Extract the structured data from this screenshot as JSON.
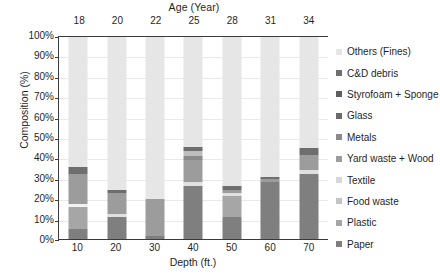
{
  "chart_data": {
    "type": "bar",
    "subtype": "stacked-100-percent",
    "title": "Age (Year)",
    "xlabel": "Depth (ft.)",
    "ylabel": "Composition (%)",
    "ylim": [
      0,
      100
    ],
    "ytick_labels": [
      "0%",
      "10%",
      "20%",
      "30%",
      "40%",
      "50%",
      "60%",
      "70%",
      "80%",
      "90%",
      "100%"
    ],
    "ytick_values": [
      0,
      10,
      20,
      30,
      40,
      50,
      60,
      70,
      80,
      90,
      100
    ],
    "grid": true,
    "legend_position": "right",
    "categories": [
      "10",
      "20",
      "30",
      "40",
      "50",
      "60",
      "70"
    ],
    "top_axis_label": "Age (Year)",
    "top_categories": [
      "18",
      "20",
      "22",
      "25",
      "28",
      "31",
      "34"
    ],
    "series": [
      {
        "name": "Paper",
        "color": "#7f7f7f",
        "values": [
          5.0,
          11.0,
          1.5,
          26.0,
          11.0,
          28.0,
          32.0
        ]
      },
      {
        "name": "Plastic",
        "color": "#a6a6a6",
        "values": [
          11.0,
          0.0,
          0.0,
          0.0,
          10.5,
          0.0,
          0.0
        ]
      },
      {
        "name": "Food waste",
        "color": "#f2f2f2",
        "values": [
          1.5,
          0.0,
          0.0,
          0.0,
          0.0,
          0.0,
          0.0
        ]
      },
      {
        "name": "Textile",
        "color": "#e0e0e0",
        "values": [
          0.0,
          1.2,
          0.0,
          2.0,
          1.5,
          0.0,
          2.0
        ]
      },
      {
        "name": "Yard waste + Wood",
        "color": "#9c9c9c",
        "values": [
          14.5,
          10.5,
          18.5,
          11.0,
          1.5,
          1.8,
          7.5
        ]
      },
      {
        "name": "Metals",
        "color": "#8a8a8a",
        "values": [
          0.0,
          0.0,
          0.0,
          2.0,
          0.0,
          0.0,
          0.0
        ]
      },
      {
        "name": "Glass",
        "color": "#bdbdbd",
        "values": [
          0.0,
          0.0,
          0.0,
          2.5,
          0.0,
          0.0,
          0.0
        ]
      },
      {
        "name": "Styrofoam + Sponge",
        "color": "#d2d2d2",
        "values": [
          0.0,
          0.0,
          0.0,
          0.0,
          0.0,
          0.0,
          0.0
        ]
      },
      {
        "name": "C&D debris",
        "color": "#6e6e6e",
        "values": [
          3.5,
          1.8,
          0.0,
          2.0,
          1.8,
          0.8,
          3.5
        ]
      },
      {
        "name": "Others (Fines)",
        "color": "#e6e6e6",
        "values": [
          64.5,
          75.5,
          80.0,
          54.5,
          73.7,
          69.4,
          55.0
        ]
      }
    ],
    "legend_entries": [
      {
        "label": "Others (Fines)",
        "color": "#e6e6e6"
      },
      {
        "label": "C&D debris",
        "color": "#6e6e6e"
      },
      {
        "label": "Styrofoam + Sponge",
        "color": "#5e5e5e"
      },
      {
        "label": "Glass",
        "color": "#6a6a6a"
      },
      {
        "label": "Metals",
        "color": "#8a8a8a"
      },
      {
        "label": "Yard waste + Wood",
        "color": "#9c9c9c"
      },
      {
        "label": "Textile",
        "color": "#d8d8d8"
      },
      {
        "label": "Food waste",
        "color": "#c4c4c4"
      },
      {
        "label": "Plastic",
        "color": "#a6a6a6"
      },
      {
        "label": "Paper",
        "color": "#7f7f7f"
      }
    ]
  }
}
